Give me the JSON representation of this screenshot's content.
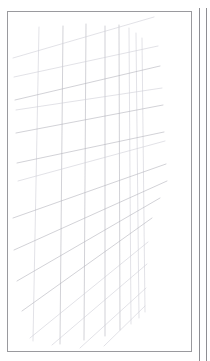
{
  "canvas": {
    "width": 210,
    "height": 361,
    "background": "#ffffff"
  },
  "panels": [
    {
      "name": "main-sheet",
      "label": "Sketch sheet",
      "x": 7,
      "y": 11,
      "width": 185,
      "height": 341,
      "border_color": "#9a9a9e",
      "fill": "#ffffff"
    },
    {
      "name": "adjacent-panel",
      "label": "Adjacent panel edge",
      "x": 199,
      "y": 8,
      "width": 8,
      "height": 353,
      "border_color": "#8e8e93",
      "fill": "#ffffff"
    }
  ],
  "drawing": {
    "title": "Perspective line grid sketch",
    "stroke_color": "#b4b4bc",
    "stroke_color_light": "#cfcfd6",
    "stroke_color_dark": "#9c9ca6",
    "stroke_width": 0.6,
    "verticals": [
      {
        "x1": 39,
        "y1": 27,
        "x2": 33,
        "y2": 341,
        "shade": "light"
      },
      {
        "x1": 63,
        "y1": 26,
        "x2": 60,
        "y2": 344,
        "shade": "mid"
      },
      {
        "x1": 86,
        "y1": 24,
        "x2": 84,
        "y2": 340,
        "shade": "mid"
      },
      {
        "x1": 105,
        "y1": 26,
        "x2": 105,
        "y2": 336,
        "shade": "mid"
      },
      {
        "x1": 119,
        "y1": 25,
        "x2": 120,
        "y2": 330,
        "shade": "mid"
      },
      {
        "x1": 129,
        "y1": 28,
        "x2": 131,
        "y2": 324,
        "shade": "light"
      },
      {
        "x1": 136,
        "y1": 33,
        "x2": 139,
        "y2": 318,
        "shade": "light"
      },
      {
        "x1": 142,
        "y1": 38,
        "x2": 145,
        "y2": 312,
        "shade": "light"
      }
    ],
    "transversals": [
      {
        "x1": 13,
        "y1": 58,
        "x2": 154,
        "y2": 17,
        "shade": "light"
      },
      {
        "x1": 14,
        "y1": 77,
        "x2": 158,
        "y2": 46,
        "shade": "light"
      },
      {
        "x1": 15,
        "y1": 100,
        "x2": 160,
        "y2": 66,
        "shade": "mid"
      },
      {
        "x1": 16,
        "y1": 110,
        "x2": 162,
        "y2": 88,
        "shade": "light"
      },
      {
        "x1": 16,
        "y1": 133,
        "x2": 163,
        "y2": 105,
        "shade": "mid"
      },
      {
        "x1": 17,
        "y1": 163,
        "x2": 164,
        "y2": 132,
        "shade": "mid"
      },
      {
        "x1": 18,
        "y1": 181,
        "x2": 165,
        "y2": 141,
        "shade": "light"
      },
      {
        "x1": 13,
        "y1": 218,
        "x2": 166,
        "y2": 164,
        "shade": "mid"
      },
      {
        "x1": 14,
        "y1": 250,
        "x2": 167,
        "y2": 181,
        "shade": "mid"
      },
      {
        "x1": 17,
        "y1": 281,
        "x2": 160,
        "y2": 198,
        "shade": "mid"
      },
      {
        "x1": 22,
        "y1": 311,
        "x2": 152,
        "y2": 218,
        "shade": "mid"
      },
      {
        "x1": 30,
        "y1": 338,
        "x2": 148,
        "y2": 242,
        "shade": "light"
      },
      {
        "x1": 52,
        "y1": 345,
        "x2": 147,
        "y2": 264,
        "shade": "light"
      },
      {
        "x1": 80,
        "y1": 348,
        "x2": 146,
        "y2": 288,
        "shade": "light"
      },
      {
        "x1": 104,
        "y1": 346,
        "x2": 145,
        "y2": 306,
        "shade": "light"
      }
    ]
  }
}
